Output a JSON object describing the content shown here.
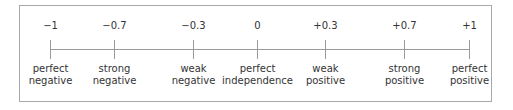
{
  "diagram": {
    "frame_color": "#a8a8a8",
    "line_color": "#9a9a9a",
    "points": [
      {
        "value": "−1",
        "label_line1": "perfect",
        "label_line2": "negative",
        "x": 50
      },
      {
        "value": "−0.7",
        "label_line1": "strong",
        "label_line2": "negative",
        "x": 114
      },
      {
        "value": "−0.3",
        "label_line1": "weak",
        "label_line2": "negative",
        "x": 193
      },
      {
        "value": "0",
        "label_line1": "perfect",
        "label_line2": "independence",
        "x": 257
      },
      {
        "value": "+0.3",
        "label_line1": "weak",
        "label_line2": "positive",
        "x": 325
      },
      {
        "value": "+0.7",
        "label_line1": "strong",
        "label_line2": "positive",
        "x": 404
      },
      {
        "value": "+1",
        "label_line1": "perfect",
        "label_line2": "positive",
        "x": 469
      }
    ]
  }
}
